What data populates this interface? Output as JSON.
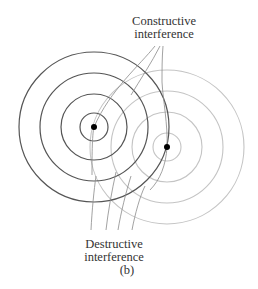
{
  "figure": {
    "panel_label": "(b)",
    "labels": {
      "constructive_line1": "Constructive",
      "constructive_line2": "interference",
      "destructive_line1": "Destructive",
      "destructive_line2": "interference"
    },
    "colors": {
      "source1_rings": "#555555",
      "source2_rings": "#c4c4c4",
      "pointer_lines": "#8a8a8a",
      "source_dots": "#000000",
      "text": "#333333"
    },
    "sources": [
      {
        "name": "source-1",
        "cx": 94,
        "cy": 127,
        "ring_radii": [
          14,
          33,
          54,
          75
        ]
      },
      {
        "name": "source-2",
        "cx": 167,
        "cy": 147,
        "ring_radii": [
          14,
          35,
          56,
          77
        ]
      }
    ]
  }
}
